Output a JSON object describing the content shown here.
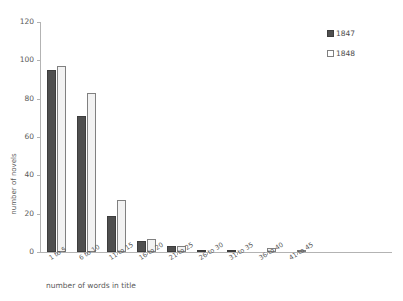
{
  "chart_data": {
    "type": "bar",
    "title": "",
    "xlabel": "number of words in title",
    "ylabel": "number of novels",
    "categories": [
      "1 to 5",
      "6 to 10",
      "11 to 15",
      "16 to 20",
      "21 to 25",
      "26 to 30",
      "31 to 35",
      "36 to 40",
      "41 to 45"
    ],
    "series": [
      {
        "name": "1847",
        "color": "#4f4f4f",
        "values": [
          95,
          71,
          19,
          6,
          3,
          1,
          1,
          0,
          0
        ]
      },
      {
        "name": "1848",
        "color": "#f2f2f2",
        "values": [
          97,
          83,
          27,
          7,
          3,
          0,
          0,
          2,
          1
        ]
      }
    ],
    "ylim": [
      0,
      120
    ],
    "yticks": [
      0,
      20,
      40,
      60,
      80,
      100,
      120
    ],
    "ytick_labels": [
      "0",
      "20",
      "40",
      "60",
      "80",
      "100",
      "120"
    ],
    "grid": false,
    "legend_position": "top-right"
  },
  "axes": {
    "y_title": "number of novels",
    "x_title": "number of words in title",
    "y_tick_labels": [
      "120",
      "100",
      "80",
      "60",
      "40",
      "20",
      "0"
    ],
    "x_tick_labels": [
      "1 to 5",
      "6 to 10",
      "11 to 15",
      "16 to 20",
      "21 to 25",
      "26 to 30",
      "31 to 35",
      "36 to 40",
      "41 to 45"
    ]
  },
  "legend": {
    "items": [
      {
        "label": "1847",
        "swatch": "filled-square-dark"
      },
      {
        "label": "1848",
        "swatch": "outlined-square-white"
      }
    ]
  }
}
